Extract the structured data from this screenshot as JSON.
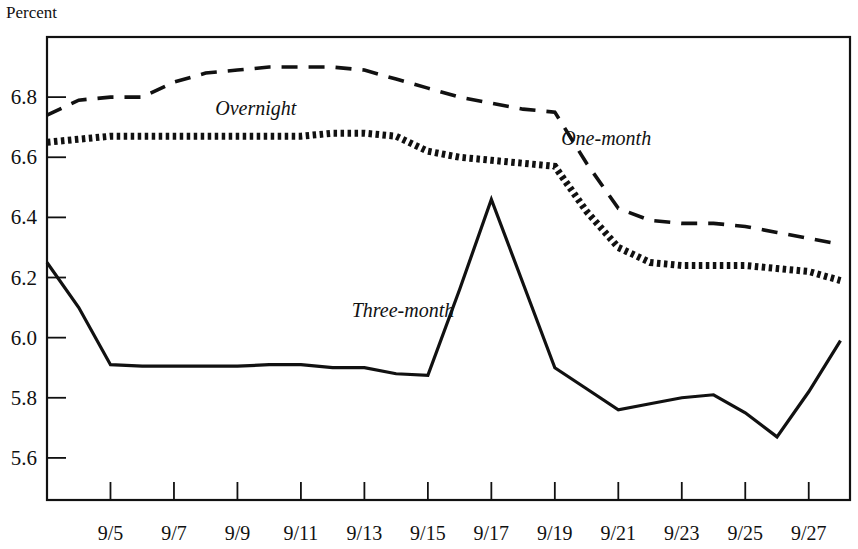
{
  "chart_data": {
    "type": "line",
    "title": "",
    "ylabel": "Percent",
    "xlabel": "",
    "ylim": [
      5.46,
      7.0
    ],
    "xlim": [
      3.0,
      28.3
    ],
    "grid": false,
    "legend": "inline-labels",
    "ytick_labels": [
      "6.8",
      "6.6",
      "6.4",
      "6.2",
      "6.0",
      "5.8",
      "5.6"
    ],
    "ytick_values": [
      6.8,
      6.6,
      6.4,
      6.2,
      6.0,
      5.8,
      5.6
    ],
    "xtick_labels": [
      "9/5",
      "9/7",
      "9/9",
      "9/11",
      "9/13",
      "9/15",
      "9/17",
      "9/19",
      "9/21",
      "9/23",
      "9/25",
      "9/27"
    ],
    "xtick_values": [
      5,
      7,
      9,
      11,
      13,
      15,
      17,
      19,
      21,
      23,
      25,
      27
    ],
    "x": [
      3,
      4,
      5,
      6,
      7,
      8,
      9,
      10,
      11,
      12,
      13,
      14,
      15,
      16,
      17,
      18,
      19,
      20,
      21,
      22,
      23,
      24,
      25,
      26,
      27,
      28
    ],
    "series": [
      {
        "name": "One-month",
        "style": "dashed",
        "color": "#111111",
        "label_x": 19.2,
        "label_y": 6.64,
        "values": [
          6.74,
          6.79,
          6.8,
          6.8,
          6.85,
          6.88,
          6.89,
          6.9,
          6.9,
          6.9,
          6.89,
          6.86,
          6.83,
          6.8,
          6.78,
          6.76,
          6.75,
          6.58,
          6.43,
          6.39,
          6.38,
          6.38,
          6.37,
          6.35,
          6.33,
          6.31
        ]
      },
      {
        "name": "Overnight",
        "style": "dotted",
        "color": "#111111",
        "label_x": 8.3,
        "label_y": 6.74,
        "values": [
          6.65,
          6.66,
          6.67,
          6.67,
          6.67,
          6.67,
          6.67,
          6.67,
          6.67,
          6.68,
          6.68,
          6.67,
          6.62,
          6.6,
          6.59,
          6.58,
          6.57,
          6.42,
          6.3,
          6.25,
          6.24,
          6.24,
          6.24,
          6.23,
          6.22,
          6.19
        ]
      },
      {
        "name": "Three-month",
        "style": "solid",
        "color": "#111111",
        "label_x": 12.6,
        "label_y": 6.07,
        "values": [
          6.25,
          6.1,
          5.91,
          5.905,
          5.905,
          5.905,
          5.905,
          5.91,
          5.91,
          5.9,
          5.9,
          5.88,
          5.875,
          6.16,
          6.46,
          6.18,
          5.9,
          5.83,
          5.76,
          5.78,
          5.8,
          5.81,
          5.75,
          5.67,
          5.82,
          5.99
        ]
      }
    ]
  }
}
